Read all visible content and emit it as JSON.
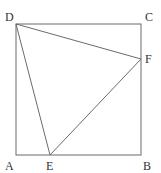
{
  "diagram": {
    "type": "geometry",
    "colors": {
      "stroke": "#6b6b6b",
      "label": "#333333",
      "background": "#ffffff"
    },
    "points": {
      "A": {
        "label": "A",
        "x": 16,
        "y": 155
      },
      "B": {
        "label": "B",
        "x": 141,
        "y": 155
      },
      "C": {
        "label": "C",
        "x": 141,
        "y": 24
      },
      "D": {
        "label": "D",
        "x": 16,
        "y": 24
      },
      "E": {
        "label": "E",
        "x": 50,
        "y": 155
      },
      "F": {
        "label": "F",
        "x": 141,
        "y": 59
      }
    },
    "segments": [
      [
        "A",
        "B"
      ],
      [
        "B",
        "C"
      ],
      [
        "C",
        "D"
      ],
      [
        "D",
        "A"
      ],
      [
        "D",
        "E"
      ],
      [
        "E",
        "F"
      ],
      [
        "F",
        "D"
      ]
    ]
  }
}
